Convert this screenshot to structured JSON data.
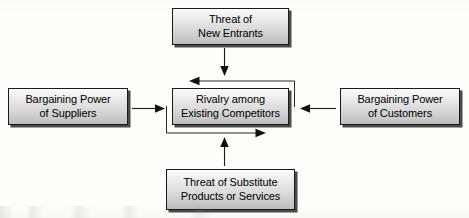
{
  "diagram": {
    "type": "five-forces-flow-diagram",
    "background_color": "#fdfdfc",
    "box_border_color": "#1a1a1a",
    "box_fill_top": "#fbfbfb",
    "box_fill_bottom": "#bdbdbd",
    "box_shadow_color": "#4a4a4a",
    "connector_color": "#1a1a1a",
    "nodes": [
      {
        "id": "new_entrants",
        "label": "Threat of\nNew Entrants",
        "position": "top"
      },
      {
        "id": "suppliers",
        "label": "Bargaining Power\nof Suppliers",
        "position": "left"
      },
      {
        "id": "rivalry",
        "label": "Rivalry among\nExisting Competitors",
        "position": "center"
      },
      {
        "id": "customers",
        "label": "Bargaining Power\nof Customers",
        "position": "right"
      },
      {
        "id": "substitutes",
        "label": "Threat of Substitute\nProducts or Services",
        "position": "bottom"
      }
    ],
    "connectors": [
      {
        "id": "new_entrants_to_rivalry",
        "from": "new_entrants",
        "to": "rivalry",
        "direction": "down"
      },
      {
        "id": "suppliers_to_rivalry",
        "from": "suppliers",
        "to": "rivalry",
        "direction": "right"
      },
      {
        "id": "customers_to_rivalry",
        "from": "customers",
        "to": "rivalry",
        "direction": "left"
      },
      {
        "id": "substitutes_to_rivalry",
        "from": "substitutes",
        "to": "rivalry",
        "direction": "up"
      },
      {
        "id": "rivalry_feedback_top",
        "from": "rivalry",
        "to": "rivalry",
        "direction": "left"
      },
      {
        "id": "rivalry_feedback_bottom",
        "from": "rivalry",
        "to": "rivalry",
        "direction": "right"
      }
    ]
  }
}
